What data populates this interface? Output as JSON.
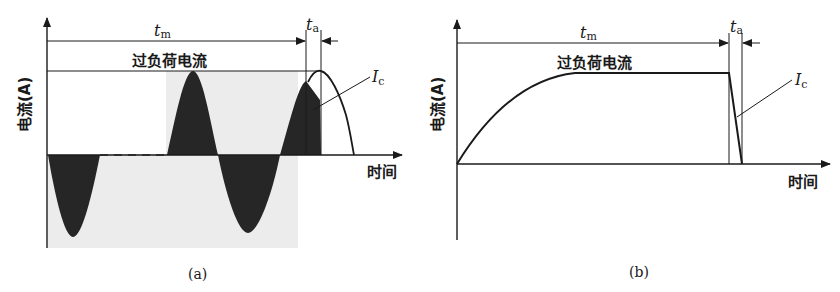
{
  "panels": [
    {
      "id": "a",
      "caption": "(a)",
      "y_axis_label": "电流(A)",
      "x_axis_label": "时间",
      "band_label": "过负荷电流",
      "tm_label": {
        "main": "t",
        "sub": "m"
      },
      "ta_label": {
        "main": "t",
        "sub": "a"
      },
      "ic_label": {
        "main": "I",
        "sub": "c"
      },
      "description": "Sinusoidal current oscillating with dark filled lobes; third positive lobe is interrupted within t_a while Ic curve peaks and falls to zero"
    },
    {
      "id": "b",
      "caption": "(b)",
      "y_axis_label": "电流(A)",
      "x_axis_label": "时间",
      "band_label": "过负荷电流",
      "tm_label": {
        "main": "t",
        "sub": "m"
      },
      "ta_label": {
        "main": "t",
        "sub": "a"
      },
      "ic_label": {
        "main": "I",
        "sub": "c"
      },
      "description": "Current rises smoothly to overload level, stays flat during t_m, then drops linearly to zero during t_a"
    }
  ]
}
